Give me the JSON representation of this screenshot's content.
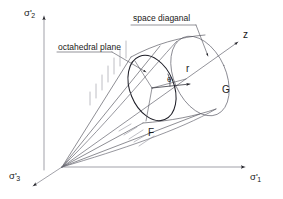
{
  "figure": {
    "type": "stress-space-diagram",
    "background_color": "#ffffff",
    "line_color": "#3c3c46",
    "text_color": "#1a1a1a"
  },
  "axes": [
    {
      "id": "sigma-2",
      "symbol": "σ",
      "prime": "'",
      "subscript": "2",
      "direction": "up",
      "label_x": 24,
      "label_y": 8
    },
    {
      "id": "sigma-1",
      "symbol": "σ",
      "prime": "'",
      "subscript": "1",
      "direction": "right",
      "label_x": 250,
      "label_y": 175
    },
    {
      "id": "sigma-3",
      "symbol": "σ",
      "prime": "'",
      "subscript": "3",
      "direction": "down-left",
      "label_x": 9,
      "label_y": 174
    }
  ],
  "annotations": [
    {
      "id": "octahedral-plane",
      "text": "octahedral plane",
      "x": 58,
      "y": 43
    },
    {
      "id": "space-diagonal",
      "text": "space diaganal",
      "x": 133,
      "y": 14
    },
    {
      "id": "z-axis",
      "text": "z",
      "x": 243,
      "y": 35
    },
    {
      "id": "radius-r",
      "text": "r",
      "x": 186,
      "y": 70
    },
    {
      "id": "angle-theta",
      "text": "θ",
      "x": 167,
      "y": 80
    },
    {
      "id": "surface-g",
      "text": "G",
      "x": 222,
      "y": 90
    },
    {
      "id": "surface-f",
      "text": "F",
      "x": 148,
      "y": 133
    }
  ]
}
